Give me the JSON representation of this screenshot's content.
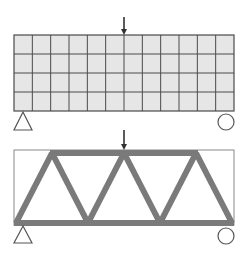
{
  "diagram": {
    "colors": {
      "background": "#ffffff",
      "mesh_fill": "#e6e6e6",
      "mesh_lines": "#4a4a4a",
      "truss_members": "#7a7a7a",
      "outline": "#8a8a8a",
      "supports": "#555555",
      "load_arrow": "#333333"
    },
    "top_panel": {
      "label": "finite-element design domain",
      "grid": {
        "columns": 12,
        "rows": 4,
        "x": 14,
        "y": 35,
        "width": 220,
        "height": 76
      },
      "load": {
        "icon": "down-arrow-icon",
        "x": 124
      },
      "supports": [
        {
          "type": "pin",
          "icon": "triangle-support-icon",
          "x": 23
        },
        {
          "type": "roller",
          "icon": "circle-roller-icon",
          "x": 226
        }
      ]
    },
    "bottom_panel": {
      "label": "optimized truss",
      "outline": {
        "x": 14,
        "y": 150,
        "width": 220,
        "height": 75
      },
      "top_nodes_x": [
        52,
        124,
        196
      ],
      "bottom_nodes_x": [
        16,
        88,
        160,
        232
      ],
      "load": {
        "icon": "down-arrow-icon",
        "x": 124
      },
      "supports": [
        {
          "type": "pin",
          "icon": "triangle-support-icon",
          "x": 23
        },
        {
          "type": "roller",
          "icon": "circle-roller-icon",
          "x": 226
        }
      ]
    }
  }
}
